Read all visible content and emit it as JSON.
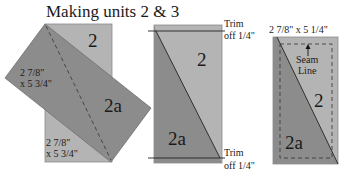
{
  "title": "Making units 2 & 3",
  "colors": {
    "light_fabric": "#b4b4b4",
    "dark_fabric": "#8c8c8c",
    "outline": "#7a7a7a",
    "line": "#2a2a2a",
    "text": "#1a1a1a",
    "background": "#ffffff"
  },
  "step1": {
    "light_label": "2",
    "dark_label": "2a",
    "dark_dim_line1": "2 7/8\"",
    "dark_dim_line2": "x 5 3/4\"",
    "light_dim_line1": "2 7/8\"",
    "light_dim_line2": "x 5 3/4\""
  },
  "step2": {
    "light_label": "2",
    "dark_label": "2a",
    "trim_top_line1": "Trim",
    "trim_top_line2": "off 1/4\"",
    "trim_bottom_line1": "Trim",
    "trim_bottom_line2": "off 1/4\""
  },
  "step3": {
    "dimension": "2 7/8\" x 5 1/4\"",
    "seam_line1": "Seam",
    "seam_line2": "Line",
    "light_label": "2",
    "dark_label": "2a"
  }
}
